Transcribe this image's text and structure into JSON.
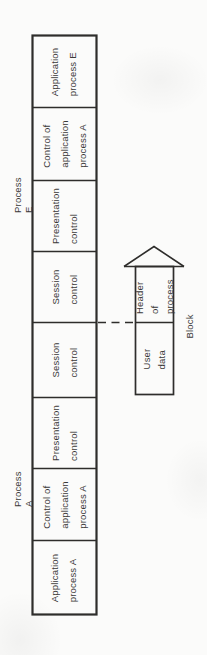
{
  "figure": {
    "background_color": "#fbfbfa",
    "line_color": "#2e2d2b",
    "text_color": "#3a3938"
  },
  "stack": {
    "process_e_label": "Process E",
    "process_a_label": "Process A",
    "cells": [
      {
        "text": "Application\nprocess E"
      },
      {
        "text": "Control of\napplication\nprocess A"
      },
      {
        "text": "Presentation\ncontrol"
      },
      {
        "text": "Session\ncontrol"
      },
      {
        "text": "Session\ncontrol"
      },
      {
        "text": "Presentation\ncontrol"
      },
      {
        "text": "Control of\napplication\nprocess A"
      },
      {
        "text": "Application\nprocess A"
      }
    ]
  },
  "block": {
    "label": "Block",
    "header_text": "Header of\nprocess",
    "user_data_text": "User\ndata"
  }
}
